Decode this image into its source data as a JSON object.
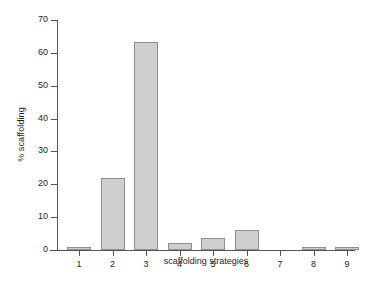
{
  "chart_data": {
    "type": "bar",
    "title": "",
    "xlabel": "scaffolding strategies",
    "ylabel": "% scaffolding",
    "categories": [
      "1",
      "2",
      "3",
      "4",
      "5",
      "6",
      "7",
      "8",
      "9"
    ],
    "values": [
      1.0,
      21.8,
      63.4,
      2.0,
      3.7,
      6.2,
      0.0,
      0.8,
      1.0
    ],
    "ylim": [
      0,
      70
    ],
    "ytick_values": [
      0,
      10,
      20,
      30,
      40,
      50,
      60,
      70
    ],
    "ytick_labels": [
      "0",
      "10",
      "20",
      "30",
      "40",
      "50",
      "60",
      "70"
    ],
    "grid": false,
    "legend": false,
    "bar_fill_color": "#cfcfcf",
    "bar_edge_color": "#8f8f8f",
    "axis_color": "#555555",
    "background_color": "#ffffff"
  }
}
